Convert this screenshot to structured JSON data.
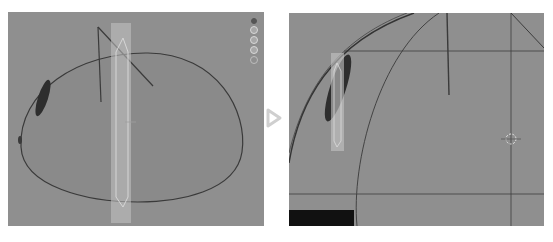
{
  "figure": {
    "layout": "before-after comparison of two 3D viewport screenshots",
    "arrow_icon": "play-triangle-outline"
  },
  "left_viewport": {
    "label": "",
    "background": "#8f8f8f",
    "objects": [
      "dome-mesh-outline",
      "dark-ellipse-eye",
      "transparent-selection-column",
      "wire-lines"
    ],
    "gizmo_buttons": [
      "camera-dot",
      "view-button-1",
      "view-button-2",
      "view-button-3",
      "view-button-4"
    ]
  },
  "right_viewport": {
    "label": "",
    "background": "#8f8f8f",
    "objects": [
      "dome-curve-outer",
      "dome-curve-inner",
      "dark-ellipse-eye",
      "selection-column",
      "crosshair-cursor",
      "axis-lines"
    ],
    "overlay": "black-bar-bottom-left"
  },
  "colors": {
    "viewport_bg": "#8f8f8f",
    "mesh_line": "#3a3a3a",
    "selection": "#c8c8c8",
    "eye": "#2e2e2e",
    "arrow": "#cfcfcf"
  }
}
